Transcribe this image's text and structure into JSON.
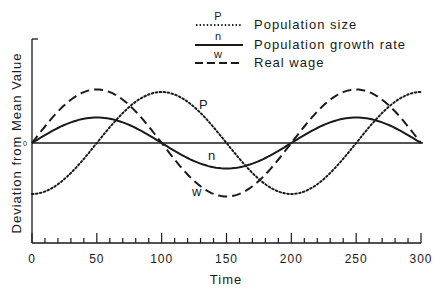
{
  "chart_data": {
    "type": "line",
    "title": "",
    "xlabel": "Time",
    "ylabel": "Deviation from Mean Value",
    "xlim": [
      0,
      300
    ],
    "x_ticks": [
      0,
      50,
      100,
      150,
      200,
      250,
      300
    ],
    "x_tick_labels": [
      "0",
      "50",
      "100",
      "150",
      "200",
      "250",
      "300"
    ],
    "x_minor_tick_step": 10,
    "y_ticks": [
      0
    ],
    "y_tick_labels": [
      "0"
    ],
    "ylim": [
      -1.9,
      2.0
    ],
    "grid": false,
    "zero_line": true,
    "legend_position": "top-right",
    "x": [
      0,
      25,
      50,
      75,
      100,
      125,
      150,
      175,
      200,
      225,
      250,
      275,
      300
    ],
    "series": [
      {
        "name": "Population size",
        "key": "P",
        "style": "dotted",
        "amplitude": 1.0,
        "phase": "-cos",
        "period": 200,
        "values": [
          -1.0,
          -0.71,
          0.0,
          0.71,
          1.0,
          0.71,
          0.0,
          -0.71,
          -1.0,
          -0.71,
          0.0,
          0.71,
          1.0
        ]
      },
      {
        "name": "Population growth rate",
        "key": "n",
        "style": "solid",
        "amplitude": 0.5,
        "phase": "sin",
        "period": 200,
        "values": [
          0.0,
          0.35,
          0.5,
          0.35,
          0.0,
          -0.35,
          -0.5,
          -0.35,
          0.0,
          0.35,
          0.5,
          0.35,
          0.0
        ]
      },
      {
        "name": "Real wage",
        "key": "w",
        "style": "dashed",
        "amplitude": 1.05,
        "phase": "sin",
        "period": 200,
        "values": [
          0.0,
          0.74,
          1.05,
          0.74,
          0.0,
          -0.74,
          -1.05,
          -0.74,
          0.0,
          0.74,
          1.05,
          0.74,
          0.0
        ]
      }
    ],
    "annotations": [
      {
        "text": "P",
        "x": 120,
        "y": 0.85
      },
      {
        "text": "n",
        "x": 137,
        "y": -0.25
      },
      {
        "text": "w",
        "x": 128,
        "y": -0.95
      }
    ]
  },
  "legend": {
    "items": [
      {
        "key": "P",
        "label": "Population size",
        "style": "dotted"
      },
      {
        "key": "n",
        "label": "Population growth rate",
        "style": "solid"
      },
      {
        "key": "w",
        "label": "Real wage",
        "style": "dashed"
      }
    ]
  },
  "labels": {
    "xlabel": "Time",
    "ylabel": "Deviation from Mean Value",
    "zero": "0",
    "curve_P": "P",
    "curve_n": "n",
    "curve_w": "w"
  },
  "colors": {
    "ink": "#1a1a1a",
    "background": "#ffffff"
  }
}
